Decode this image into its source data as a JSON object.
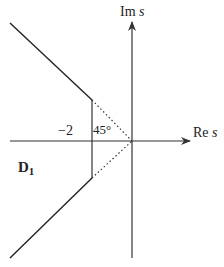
{
  "diagram": {
    "axes": {
      "imaginary_label": "Im",
      "imaginary_var": "s",
      "real_label": "Re",
      "real_var": "s"
    },
    "annotations": {
      "tick_label": "−2",
      "angle_label": "45°",
      "region_label": "D",
      "region_subscript": "1"
    },
    "colors": {
      "line": "#222222",
      "axis": "#333333"
    }
  }
}
